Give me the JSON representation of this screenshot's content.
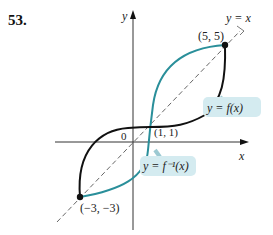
{
  "problem_number": "53.",
  "axes": {
    "x_label": "x",
    "y_label": "y",
    "origin_label": "0"
  },
  "lines": {
    "identity_label": "y = x"
  },
  "curves": {
    "f": {
      "label": "y = f(x)",
      "color": "#111111"
    },
    "f_inverse": {
      "label": "y = f⁻¹(x)",
      "color": "#2a8f9a"
    }
  },
  "points": [
    {
      "label": "(5, 5)",
      "x": 5,
      "y": 5
    },
    {
      "label": "(1, 1)",
      "x": 1,
      "y": 1
    },
    {
      "label": "(−3, −3)",
      "x": -3,
      "y": -3
    }
  ],
  "colors": {
    "callout_bg": "#d4ebf0",
    "axis": "#333333",
    "dashed": "#555555"
  }
}
